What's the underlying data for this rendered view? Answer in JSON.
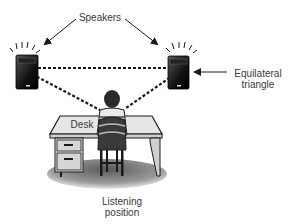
{
  "diagram": {
    "type": "speaker-placement",
    "labels": {
      "speakers": "Speakers",
      "equilateral_line1": "Equilateral",
      "equilateral_line2": "triangle",
      "desk": "Desk",
      "listening_line1": "Listening",
      "listening_line2": "position"
    },
    "icons": {
      "left_speaker": "speaker-icon",
      "right_speaker": "speaker-icon",
      "listener": "person-back-view-icon",
      "desk": "desk-icon",
      "chair": "chair-icon"
    },
    "colors": {
      "ink": "#1a1a1a",
      "text": "#3a3a3a",
      "desk_top": "#e6e6e6",
      "floor_shadow": "#9a9a9a"
    }
  }
}
